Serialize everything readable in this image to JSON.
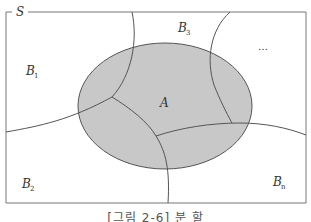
{
  "figure": {
    "sample_space_label": "S",
    "event_label": "A",
    "partitions": [
      {
        "name": "B",
        "subscript": "1"
      },
      {
        "name": "B",
        "subscript": "2"
      },
      {
        "name": "B",
        "subscript": "3"
      },
      {
        "name": "B",
        "subscript": "n"
      }
    ],
    "ellipsis": "…",
    "caption": "[그림 2-6] 분  할",
    "colors": {
      "event_fill": "#c8c8c8",
      "lines": "#555555",
      "frame": "#777777"
    }
  }
}
